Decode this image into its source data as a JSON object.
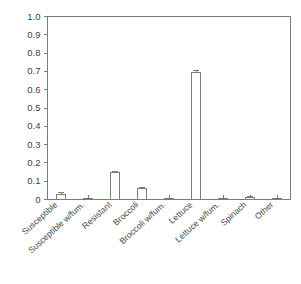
{
  "chart_data": {
    "type": "bar",
    "title": "",
    "xlabel": "",
    "ylabel": "",
    "ylim": [
      0,
      1.0
    ],
    "grid": false,
    "legend": null,
    "categories": [
      "Susceptible",
      "Susceptible w/fum.",
      "Resistant",
      "Broccoli",
      "Broccoli w/fum.",
      "Lettuce",
      "Lettuce w/fum.",
      "Spinach",
      "Other"
    ],
    "values": [
      0.03,
      0.004,
      0.145,
      0.06,
      0.004,
      0.695,
      0.004,
      0.012,
      0.003
    ],
    "errors": [
      0.006,
      0.001,
      0.006,
      0.004,
      0.001,
      0.008,
      0.001,
      0.004,
      0.001
    ],
    "ytick_labels": [
      "1.0",
      "0.9",
      "0.8",
      "0.7",
      "0.6",
      "0.5",
      "0.4",
      "0.3",
      "0.2",
      "0.1",
      "0"
    ],
    "ytick_values": [
      1.0,
      0.9,
      0.8,
      0.7,
      0.6,
      0.5,
      0.4,
      0.3,
      0.2,
      0.1,
      0.0
    ],
    "bar_fill_color": "#ffffff",
    "bar_edge_color": "#6f6f6f",
    "axis_color": "#7b7b7b",
    "background_color": "#ffffff"
  }
}
